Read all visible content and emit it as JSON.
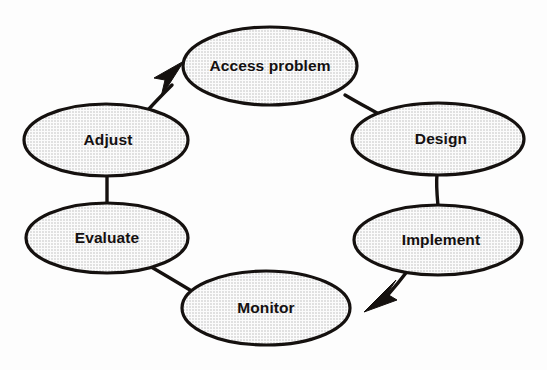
{
  "diagram": {
    "type": "cycle",
    "background_color": "#fdfdfd",
    "node_fill_color": "#e9e9e9",
    "node_stroke_color": "#15110f",
    "label_color": "#141010",
    "nodes": [
      {
        "id": "access-problem",
        "label": "Access problem",
        "cx": 270,
        "cy": 66,
        "rx": 87,
        "ry": 39
      },
      {
        "id": "design",
        "label": "Design",
        "cx": 438,
        "cy": 139,
        "rx": 86,
        "ry": 36
      },
      {
        "id": "implement",
        "label": "Implement",
        "cx": 438,
        "cy": 240,
        "rx": 84,
        "ry": 35
      },
      {
        "id": "monitor",
        "label": "Monitor",
        "cx": 266,
        "cy": 308,
        "rx": 84,
        "ry": 37
      },
      {
        "id": "evaluate",
        "label": "Evaluate",
        "cx": 107,
        "cy": 238,
        "rx": 81,
        "ry": 35
      },
      {
        "id": "adjust",
        "label": "Adjust",
        "cx": 106,
        "cy": 140,
        "rx": 82,
        "ry": 36
      }
    ],
    "edges": [
      {
        "id": "access-problem-to-design",
        "from": "access-problem",
        "to": "design",
        "arrow": false
      },
      {
        "id": "design-to-implement",
        "from": "design",
        "to": "implement",
        "arrow": false
      },
      {
        "id": "implement-to-monitor",
        "from": "implement",
        "to": "monitor",
        "arrow": true
      },
      {
        "id": "monitor-to-evaluate",
        "from": "monitor",
        "to": "evaluate",
        "arrow": false
      },
      {
        "id": "evaluate-to-adjust",
        "from": "evaluate",
        "to": "adjust",
        "arrow": false
      },
      {
        "id": "adjust-to-access-problem",
        "from": "adjust",
        "to": "access-problem",
        "arrow": true
      }
    ]
  }
}
